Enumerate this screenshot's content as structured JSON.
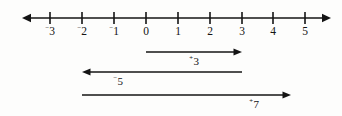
{
  "figure": {
    "background_color": "#fdfdfc",
    "ink_color": "#141414",
    "axis": {
      "name": "number-line",
      "y": 18,
      "x_start": 22,
      "x_end": 331,
      "left_arrow": true,
      "right_arrow": true,
      "origin_x": 146,
      "unit_px": 32,
      "tick_half_height": 6,
      "ticks": [
        {
          "value": -3,
          "sign": "⁻",
          "digits": "3",
          "x": 50
        },
        {
          "value": -2,
          "sign": "⁻",
          "digits": "2",
          "x": 82
        },
        {
          "value": -1,
          "sign": "⁻",
          "digits": "1",
          "x": 114
        },
        {
          "value": 0,
          "sign": "",
          "digits": "0",
          "x": 146
        },
        {
          "value": 1,
          "sign": "",
          "digits": "1",
          "x": 178
        },
        {
          "value": 2,
          "sign": "",
          "digits": "2",
          "x": 210
        },
        {
          "value": 3,
          "sign": "",
          "digits": "3",
          "x": 242
        },
        {
          "value": 4,
          "sign": "",
          "digits": "4",
          "x": 273
        },
        {
          "value": 5,
          "sign": "",
          "digits": "5",
          "x": 305
        }
      ],
      "tick_label_y": 26
    },
    "vectors": [
      {
        "name": "vector-plus-three",
        "label_sign": "⁺",
        "label_digits": "3",
        "value": 3,
        "from_value": 0,
        "to_value": 3,
        "x_start": 146,
        "x_end": 242,
        "y": 52,
        "direction": "right",
        "label_x": 194,
        "label_y": 56
      },
      {
        "name": "vector-minus-five",
        "label_sign": "⁻",
        "label_digits": "5",
        "value": -5,
        "from_value": 3,
        "to_value": -2,
        "x_start": 242,
        "x_end": 82,
        "y": 72,
        "direction": "left",
        "label_x": 118,
        "label_y": 76
      },
      {
        "name": "vector-plus-seven",
        "label_sign": "⁺",
        "label_digits": "7",
        "value": 7,
        "from_value": -2,
        "to_value": 4.5,
        "x_start": 82,
        "x_end": 291,
        "y": 95,
        "direction": "right",
        "label_x": 254,
        "label_y": 99
      }
    ]
  }
}
